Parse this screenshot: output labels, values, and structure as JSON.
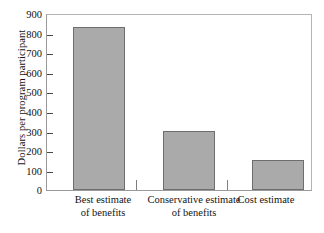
{
  "chart_data": {
    "type": "bar",
    "title": "",
    "subtitle": "",
    "xlabel": "",
    "ylabel": "Dollars per program participant",
    "categories": [
      "Best estimate of benefits",
      "Conservative estimate of benefits",
      "Cost estimate"
    ],
    "category_lines": [
      [
        "Best estimate",
        "of benefits"
      ],
      [
        "Conservative estimate",
        "of benefits"
      ],
      [
        "Cost estimate",
        ""
      ]
    ],
    "values": [
      840,
      305,
      155
    ],
    "ylim": [
      0,
      900
    ],
    "ytick_step": 100,
    "yticks": [
      900,
      800,
      700,
      600,
      500,
      400,
      300,
      200,
      100,
      0
    ],
    "ytick_labels": [
      "900",
      "800",
      "700",
      "600",
      "500",
      "400",
      "300",
      "200",
      "100",
      "0"
    ],
    "grid": false,
    "legend": null,
    "legend_position": "none",
    "bar_fill_color": "#aaaaaa",
    "bar_edge_color": "#6e6e6e",
    "frame_color": "#9a9a9a",
    "background_color": "#ffffff"
  },
  "axis": {
    "y_title": "Dollars per program participant",
    "tick_0": "900",
    "tick_1": "800",
    "tick_2": "700",
    "tick_3": "600",
    "tick_4": "500",
    "tick_5": "400",
    "tick_6": "300",
    "tick_7": "200",
    "tick_8": "100",
    "tick_9": "0"
  },
  "categories": {
    "c0_line1": "Best estimate",
    "c0_line2": "of benefits",
    "c1_line1": "Conservative estimate",
    "c1_line2": "of benefits",
    "c2_line1": "Cost estimate",
    "c2_line2": ""
  }
}
